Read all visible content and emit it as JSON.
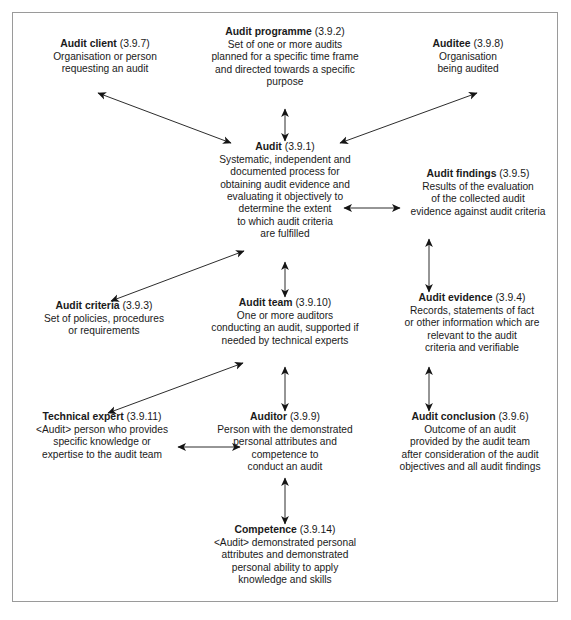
{
  "diagram": {
    "frame_color": "#9a9a9a",
    "text_color": "#1a1a1a",
    "arrow_color": "#1a1a1a",
    "nodes": [
      {
        "id": "audit-client",
        "term": "Audit client",
        "ref": "(3.9.7)",
        "desc": "Organisation or person\nrequesting an audit"
      },
      {
        "id": "audit-programme",
        "term": "Audit programme",
        "ref": "(3.9.2)",
        "desc": "Set of one or more audits\nplanned for a specific time frame\nand directed towards a specific\npurpose"
      },
      {
        "id": "auditee",
        "term": "Auditee",
        "ref": "(3.9.8)",
        "desc": "Organisation\nbeing audited"
      },
      {
        "id": "audit",
        "term": "Audit",
        "ref": "(3.9.1)",
        "desc": "Systematic, independent and\ndocumented process for\nobtaining audit evidence and\nevaluating it objectively to\ndetermine the extent\nto which audit criteria\nare fulfilled"
      },
      {
        "id": "audit-findings",
        "term": "Audit findings",
        "ref": "(3.9.5)",
        "desc": "Results of the evaluation\nof the collected audit\nevidence against audit criteria"
      },
      {
        "id": "audit-criteria",
        "term": "Audit criteria",
        "ref": "(3.9.3)",
        "desc": "Set of policies, procedures\nor requirements"
      },
      {
        "id": "audit-team",
        "term": "Audit team",
        "ref": "(3.9.10)",
        "desc": "One or more auditors\nconducting an audit, supported if\nneeded by technical experts"
      },
      {
        "id": "audit-evidence",
        "term": "Audit evidence",
        "ref": "(3.9.4)",
        "desc": "Records, statements of fact\nor other information which are\nrelevant to the audit\ncriteria and verifiable"
      },
      {
        "id": "technical-expert",
        "term": "Technical expert",
        "ref": "(3.9.11)",
        "desc": "<Audit> person who provides\nspecific knowledge or\nexpertise to the audit team"
      },
      {
        "id": "auditor",
        "term": "Auditor",
        "ref": "(3.9.9)",
        "desc": "Person with the demonstrated\npersonal attributes and\ncompetence to\nconduct an audit"
      },
      {
        "id": "audit-conclusion",
        "term": "Audit conclusion",
        "ref": "(3.9.6)",
        "desc": "Outcome of an audit\nprovided by the audit team\nafter consideration of the audit\nobjectives and all audit findings"
      },
      {
        "id": "competence",
        "term": "Competence",
        "ref": "(3.9.14)",
        "desc": "<Audit> demonstrated personal\nattributes and demonstrated\npersonal ability to apply\nknowledge and skills"
      }
    ],
    "connections": [
      {
        "id": "conn-audit-client-audit",
        "from": "audit-client",
        "to": "audit",
        "style": "double-headed",
        "orientation": "diagonal"
      },
      {
        "id": "conn-audit-programme-audit",
        "from": "audit-programme",
        "to": "audit",
        "style": "double-headed",
        "orientation": "vertical"
      },
      {
        "id": "conn-auditee-audit",
        "from": "auditee",
        "to": "audit",
        "style": "double-headed",
        "orientation": "diagonal"
      },
      {
        "id": "conn-audit-audit-findings",
        "from": "audit",
        "to": "audit-findings",
        "style": "double-headed",
        "orientation": "horizontal"
      },
      {
        "id": "conn-audit-criteria-audit",
        "from": "audit-criteria",
        "to": "audit",
        "style": "double-headed",
        "orientation": "diagonal"
      },
      {
        "id": "conn-audit-audit-team",
        "from": "audit",
        "to": "audit-team",
        "style": "double-headed",
        "orientation": "vertical"
      },
      {
        "id": "conn-audit-findings-audit-evidence",
        "from": "audit-findings",
        "to": "audit-evidence",
        "style": "double-headed",
        "orientation": "vertical"
      },
      {
        "id": "conn-technical-expert-audit-team",
        "from": "technical-expert",
        "to": "audit-team",
        "style": "double-headed",
        "orientation": "diagonal"
      },
      {
        "id": "conn-audit-team-auditor",
        "from": "audit-team",
        "to": "auditor",
        "style": "double-headed",
        "orientation": "vertical"
      },
      {
        "id": "conn-audit-evidence-audit-conclusion",
        "from": "audit-evidence",
        "to": "audit-conclusion",
        "style": "double-headed",
        "orientation": "vertical"
      },
      {
        "id": "conn-technical-expert-auditor",
        "from": "technical-expert",
        "to": "auditor",
        "style": "double-headed",
        "orientation": "horizontal"
      },
      {
        "id": "conn-auditor-competence",
        "from": "auditor",
        "to": "competence",
        "style": "double-headed",
        "orientation": "vertical"
      }
    ]
  }
}
